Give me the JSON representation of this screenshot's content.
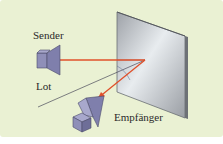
{
  "labels": {
    "sender": "Sender",
    "lot": "Lot",
    "receiver": "Empfänger"
  },
  "colors": {
    "background": "#eaf1d3",
    "beam": "#e0502a",
    "device_fill": "#8f8fb8",
    "device_dark": "#6e6e98",
    "mirror": "#c4c8cc",
    "line": "#4a4a5a"
  }
}
